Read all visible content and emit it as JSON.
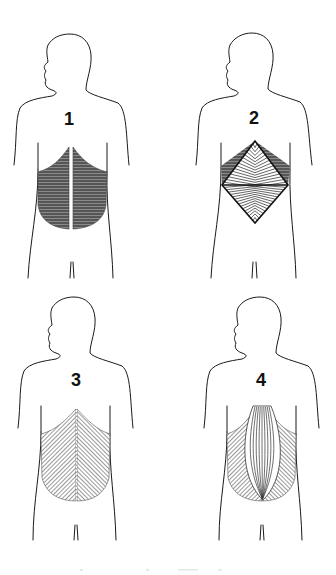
{
  "figure": {
    "panels": [
      {
        "id": 1,
        "label": "1",
        "pattern": "horizontal-hatch-with-midline-gap",
        "description": "Back muscle region shaded with horizontal lines, split by a vertical white midline"
      },
      {
        "id": 2,
        "label": "2",
        "pattern": "diamond-radiating-lines",
        "description": "Diamond-shaped pattern of converging lines over the lower back"
      },
      {
        "id": 3,
        "label": "3",
        "pattern": "diagonal-hatch-with-dotted-midline",
        "description": "Back region with fine diagonal hatching and dotted white midline"
      },
      {
        "id": 4,
        "label": "4",
        "pattern": "vertical-fan-center-diagonal-sides",
        "description": "Central vertical fanning lines with diagonal hatching on sides"
      }
    ],
    "colors": {
      "background": "#ffffff",
      "outline": "#1a1a1a",
      "hatch": "#3a3a3a"
    }
  }
}
